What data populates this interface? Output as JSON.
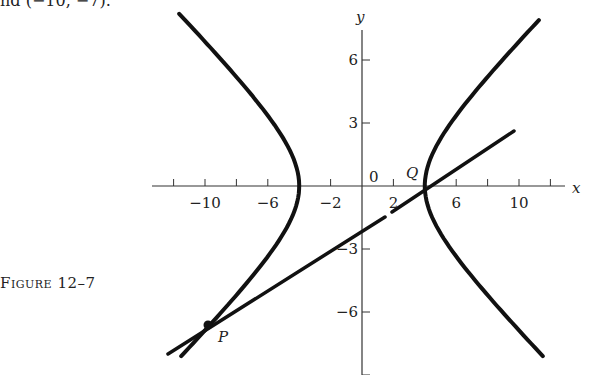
{
  "header_fragment": "nd (−10, −7).",
  "caption": "Figure 12–7",
  "axes": {
    "x_label": "x",
    "y_label": "y",
    "origin_label": "0",
    "x_ticks": [
      -12,
      -10,
      -8,
      -6,
      -4,
      -2,
      0,
      2,
      4,
      6,
      8,
      10,
      12
    ],
    "x_tick_labels": [
      {
        "value": -10,
        "text": "−10"
      },
      {
        "value": -6,
        "text": "−6"
      },
      {
        "value": -2,
        "text": "−2"
      },
      {
        "value": 2,
        "text": "2"
      },
      {
        "value": 6,
        "text": "6"
      },
      {
        "value": 10,
        "text": "10"
      }
    ],
    "y_ticks": [
      -9,
      -6,
      -3,
      0,
      3,
      6
    ],
    "y_tick_labels": [
      {
        "value": 6,
        "text": "6"
      },
      {
        "value": 3,
        "text": "3"
      },
      {
        "value": -3,
        "text": "−3"
      },
      {
        "value": -6,
        "text": "−6"
      }
    ]
  },
  "curves": {
    "hyperbola": {
      "equation": "x²/16 − y²/9 = 1",
      "a": 4,
      "b": 3
    },
    "line": {
      "through": [
        "P",
        "Q"
      ]
    }
  },
  "points": {
    "P": {
      "label": "P",
      "x": -9.7,
      "y": -6.6
    },
    "Q": {
      "label": "Q",
      "x": 4,
      "y": 0
    }
  },
  "colors": {
    "ink": "#111111",
    "background": "#ffffff"
  }
}
